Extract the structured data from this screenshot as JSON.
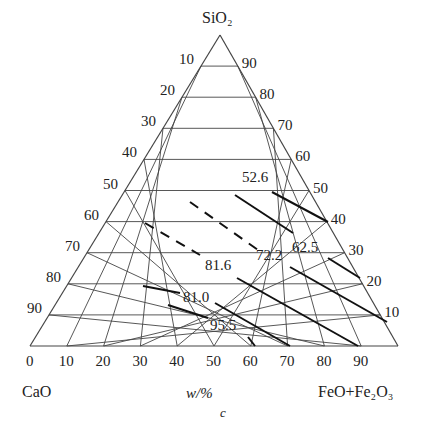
{
  "diagram": {
    "type": "ternary",
    "apex_label": "SiO₂",
    "left_label": "CaO",
    "right_label": "FeO+Fe₂O₃",
    "axis_unit": "w/%",
    "panel_label": "c",
    "left_ticks": [
      "10",
      "20",
      "30",
      "40",
      "50",
      "60",
      "70",
      "80",
      "90"
    ],
    "right_ticks": [
      "90",
      "80",
      "70",
      "60",
      "50",
      "40",
      "30",
      "20",
      "10"
    ],
    "bottom_ticks": [
      "0",
      "10",
      "20",
      "30",
      "40",
      "50",
      "60",
      "70",
      "80",
      "90"
    ],
    "contour_labels": [
      "52.6",
      "72.2",
      "62.5",
      "81.6",
      "81.0",
      "95.5"
    ],
    "colors": {
      "grid": "#444444",
      "contour": "#111111"
    }
  }
}
